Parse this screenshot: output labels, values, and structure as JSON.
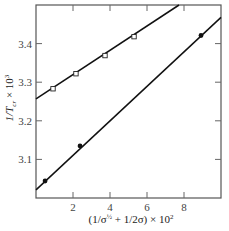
{
  "chart_data": {
    "type": "scatter",
    "title": "",
    "xlabel": "(1/σ½ + 1/2σ) × 10²",
    "ylabel": "1/T_cr × 10³",
    "ylabel_parts": {
      "main": "1/T",
      "sub": "cr",
      "tail": " × 10",
      "sup": "3"
    },
    "xlabel_parts": {
      "main": "(1/σ",
      "sup1": "½",
      "mid": " + 1/2σ) × 10",
      "sup2": "2"
    },
    "xlim": [
      0,
      10
    ],
    "ylim": [
      3.0,
      3.5
    ],
    "xticks": [
      2,
      4,
      6,
      8
    ],
    "xtick_labels": [
      "2",
      "4",
      "6",
      "8"
    ],
    "yticks": [
      3.1,
      3.2,
      3.3,
      3.4
    ],
    "ytick_labels": [
      "3.1",
      "3.2",
      "3.3",
      "3.4"
    ],
    "grid": false,
    "legend": null,
    "series": [
      {
        "name": "open squares",
        "marker": "open-square",
        "points": [
          [
            0.92,
            3.283
          ],
          [
            2.16,
            3.322
          ],
          [
            3.73,
            3.369
          ],
          [
            5.3,
            3.418
          ]
        ],
        "fit_line": {
          "x": [
            0,
            7.73
          ],
          "y": [
            3.257,
            3.5
          ]
        }
      },
      {
        "name": "filled circles",
        "marker": "filled-circle",
        "points": [
          [
            0.49,
            3.044
          ],
          [
            2.38,
            3.135
          ],
          [
            8.92,
            3.421
          ]
        ],
        "fit_line": {
          "x": [
            0,
            10
          ],
          "y": [
            3.021,
            3.468
          ]
        }
      }
    ]
  }
}
